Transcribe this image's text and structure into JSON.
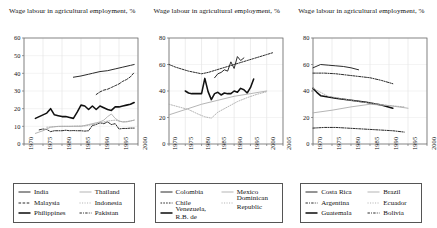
{
  "figure": {
    "title_shared": "Wage labour in agricultural employment, %",
    "panel_count": 3
  },
  "panels": [
    {
      "id": "panel-asia",
      "title": "Wage labour in agricultural employment, %",
      "yticks": [
        "0",
        "10",
        "20",
        "30",
        "40",
        "50",
        "60"
      ],
      "xticks": [
        "1970",
        "1975",
        "1980",
        "1985",
        "1990",
        "1995",
        "2000"
      ],
      "legend": [
        {
          "label": "India",
          "style": "solid",
          "weight": "medium",
          "color": "#2a2a2a"
        },
        {
          "label": "Thailand",
          "style": "solid",
          "weight": "thin",
          "color": "#a8a8a8"
        },
        {
          "label": "Malaysia",
          "style": "dashed",
          "weight": "medium",
          "color": "#2a2a2a"
        },
        {
          "label": "Indonesia",
          "style": "dotted",
          "weight": "thin",
          "color": "#b0b0b0"
        },
        {
          "label": "Philippines",
          "style": "solid",
          "weight": "bold",
          "color": "#111111"
        },
        {
          "label": "Pakistan",
          "style": "dashdot",
          "weight": "medium",
          "color": "#2a2a2a"
        }
      ]
    },
    {
      "id": "panel-latam-north",
      "title": "Wage labour in agricultural employment, %",
      "yticks": [
        "0",
        "20",
        "40",
        "60",
        "80"
      ],
      "xticks": [
        "1970",
        "1975",
        "1980",
        "1985",
        "1990",
        "1995",
        "2000",
        "2005"
      ],
      "legend": [
        {
          "label": "Colombia",
          "style": "solid",
          "weight": "medium",
          "color": "#2a2a2a"
        },
        {
          "label": "Mexico",
          "style": "solid",
          "weight": "thin",
          "color": "#a8a8a8"
        },
        {
          "label": "Chile",
          "style": "dotted",
          "weight": "medium",
          "color": "#2a2a2a"
        },
        {
          "label": "Dominican Republic",
          "style": "dotted",
          "weight": "thin",
          "color": "#b0b0b0"
        },
        {
          "label": "Venezuela, R.B. de",
          "style": "solid",
          "weight": "bold",
          "color": "#111111"
        },
        {
          "label": "",
          "style": "none",
          "weight": "none",
          "color": "#ffffff"
        }
      ]
    },
    {
      "id": "panel-latam-south",
      "title": "Wage labour in agricultural employment, %",
      "yticks": [
        "0",
        "20",
        "40",
        "60",
        "80"
      ],
      "xticks": [
        "1970",
        "1975",
        "1980",
        "1985",
        "1990",
        "1995",
        "2000"
      ],
      "legend": [
        {
          "label": "Costa Rica",
          "style": "solid",
          "weight": "medium",
          "color": "#2a2a2a"
        },
        {
          "label": "Brazil",
          "style": "solid",
          "weight": "thin",
          "color": "#a8a8a8"
        },
        {
          "label": "Argentina",
          "style": "dashdot",
          "weight": "medium",
          "color": "#2a2a2a"
        },
        {
          "label": "Ecuador",
          "style": "dotted",
          "weight": "thin",
          "color": "#b0b0b0"
        },
        {
          "label": "Guatemala",
          "style": "solid",
          "weight": "bold",
          "color": "#111111"
        },
        {
          "label": "Bolivia",
          "style": "dashdot",
          "weight": "medium",
          "color": "#2a2a2a"
        }
      ]
    }
  ],
  "chart_data": [
    {
      "type": "line",
      "id": "panel-asia",
      "title": "Wage labour in agricultural employment, %",
      "xlabel": "",
      "ylabel": "",
      "xlim": [
        1970,
        2000
      ],
      "ylim": [
        0,
        60
      ],
      "ytick_step": 10,
      "xtick_step": 5,
      "grid": true,
      "legend_position": "below",
      "series": [
        {
          "name": "Philippines",
          "style": "solid-bold",
          "x": [
            1973,
            1974,
            1975,
            1976,
            1977,
            1978,
            1979,
            1980,
            1981,
            1982,
            1983,
            1984,
            1985,
            1986,
            1987,
            1988,
            1989,
            1990,
            1991,
            1992,
            1993,
            1994,
            1995,
            1996,
            1997,
            1998,
            1999
          ],
          "y": [
            14.5,
            15.5,
            16.5,
            17.5,
            20.0,
            16.5,
            16.0,
            15.5,
            15.5,
            15.0,
            14.5,
            18.0,
            22.0,
            21.5,
            19.5,
            21.5,
            19.5,
            21.5,
            20.5,
            19.5,
            19.0,
            21.0,
            21.0,
            21.5,
            22.0,
            22.5,
            23.5
          ]
        },
        {
          "name": "India",
          "style": "solid-medium",
          "x": [
            1983,
            1985,
            1987,
            1988,
            1990,
            1992,
            1994,
            1996,
            1998,
            1999
          ],
          "y": [
            37.8,
            38.5,
            39.5,
            40.0,
            41.0,
            41.5,
            42.5,
            43.5,
            44.5,
            45.0
          ]
        },
        {
          "name": "Malaysia",
          "style": "dashed-medium",
          "x": [
            1989,
            1990,
            1991,
            1992,
            1993,
            1994,
            1995,
            1996,
            1997,
            1998,
            1999
          ],
          "y": [
            28.0,
            29.5,
            30.5,
            31.0,
            32.0,
            33.0,
            34.0,
            35.5,
            36.5,
            38.0,
            40.5
          ]
        },
        {
          "name": "Pakistan",
          "style": "dashdot-medium",
          "x": [
            1974,
            1975,
            1976,
            1977,
            1978,
            1979,
            1980,
            1981,
            1982,
            1983,
            1984,
            1985,
            1986,
            1987,
            1988,
            1989,
            1990,
            1991,
            1992,
            1993,
            1994,
            1995,
            1996,
            1997,
            1998,
            1999
          ],
          "y": [
            8.0,
            8.5,
            8.2,
            7.0,
            7.5,
            7.5,
            7.5,
            7.8,
            7.5,
            7.6,
            7.5,
            7.5,
            7.3,
            7.5,
            10.5,
            11.0,
            12.0,
            11.5,
            12.5,
            11.0,
            11.5,
            8.5,
            8.8,
            8.8,
            9.0,
            9.0
          ]
        },
        {
          "name": "Thailand",
          "style": "solid-thin",
          "x": [
            1973,
            1975,
            1977,
            1979,
            1981,
            1983,
            1985,
            1987,
            1989,
            1990,
            1991,
            1992,
            1993,
            1994,
            1995,
            1996,
            1997,
            1998,
            1999
          ],
          "y": [
            6.0,
            7.5,
            9.5,
            10.0,
            10.0,
            10.0,
            10.0,
            11.0,
            12.0,
            12.5,
            13.5,
            15.5,
            17.0,
            14.5,
            13.0,
            12.5,
            12.5,
            13.0,
            13.5
          ]
        },
        {
          "name": "Indonesia",
          "style": "dotted-thin",
          "x": [
            1976,
            1978,
            1980,
            1982,
            1984,
            1986,
            1988,
            1990,
            1992,
            1994,
            1996,
            1998,
            1999
          ],
          "y": [
            9.5,
            9.8,
            10.0,
            10.0,
            10.2,
            10.2,
            11.0,
            12.0,
            13.0,
            13.5,
            12.5,
            13.0,
            13.5
          ]
        }
      ]
    },
    {
      "type": "line",
      "id": "panel-latam-north",
      "title": "Wage labour in agricultural employment, %",
      "xlabel": "",
      "ylabel": "",
      "xlim": [
        1970,
        2005
      ],
      "ylim": [
        0,
        80
      ],
      "ytick_step": 20,
      "xtick_step": 5,
      "grid": true,
      "legend_position": "below",
      "series": [
        {
          "name": "Chile",
          "style": "dotted-medium",
          "x": [
            1970,
            1972,
            1974,
            1976,
            1978,
            1980,
            1982,
            1984,
            1986,
            1988,
            1990,
            1992,
            1994,
            1996,
            1998,
            2000,
            2002
          ],
          "y": [
            60.0,
            58.0,
            56.5,
            55.0,
            54.0,
            53.0,
            54.0,
            55.5,
            57.0,
            58.5,
            60.0,
            61.5,
            63.0,
            64.5,
            66.0,
            67.5,
            69.0
          ]
        },
        {
          "name": "Venezuela, R.B. de",
          "style": "solid-bold",
          "x": [
            1975,
            1976,
            1977,
            1978,
            1979,
            1980,
            1981,
            1982,
            1983,
            1984,
            1985,
            1986,
            1987,
            1988,
            1989,
            1990,
            1991,
            1992,
            1993,
            1994,
            1995,
            1996
          ],
          "y": [
            40.0,
            38.5,
            38.0,
            38.0,
            38.0,
            38.0,
            49.5,
            39.5,
            33.5,
            38.0,
            39.0,
            37.0,
            38.5,
            38.0,
            38.0,
            40.0,
            39.0,
            42.0,
            41.0,
            38.5,
            42.5,
            49.0
          ]
        },
        {
          "name": "Colombia",
          "style": "solid-medium",
          "x": [
            1984,
            1985,
            1986,
            1987,
            1988,
            1989,
            1990,
            1991,
            1992,
            1993
          ],
          "y": [
            50.0,
            53.0,
            54.0,
            56.0,
            55.0,
            62.0,
            57.0,
            66.0,
            63.0,
            65.0
          ]
        },
        {
          "name": "Mexico",
          "style": "solid-thin",
          "x": [
            1970,
            1975,
            1980,
            1985,
            1990,
            1995,
            2000
          ],
          "y": [
            22.0,
            26.0,
            30.0,
            33.0,
            36.0,
            38.0,
            40.0
          ]
        },
        {
          "name": "Dominican Republic",
          "style": "dotted-thin",
          "x": [
            1970,
            1973,
            1976,
            1979,
            1981,
            1983,
            1985,
            1988,
            1991,
            1994,
            1997,
            2000
          ],
          "y": [
            30.0,
            28.0,
            26.0,
            22.5,
            20.5,
            19.5,
            24.0,
            28.0,
            32.0,
            35.0,
            37.5,
            39.5
          ]
        }
      ]
    },
    {
      "type": "line",
      "id": "panel-latam-south",
      "title": "Wage labour in agricultural employment, %",
      "xlabel": "",
      "ylabel": "",
      "xlim": [
        1970,
        2000
      ],
      "ylim": [
        0,
        80
      ],
      "ytick_step": 20,
      "xtick_step": 5,
      "grid": true,
      "legend_position": "below",
      "series": [
        {
          "name": "Costa Rica",
          "style": "solid-medium",
          "x": [
            1970,
            1972,
            1974,
            1976,
            1978,
            1980,
            1982
          ],
          "y": [
            57.5,
            60.0,
            59.5,
            59.0,
            58.5,
            57.5,
            56.0
          ]
        },
        {
          "name": "Argentina",
          "style": "dashdot-medium",
          "x": [
            1970,
            1973,
            1976,
            1979,
            1982,
            1985,
            1988,
            1991
          ],
          "y": [
            53.5,
            53.5,
            53.0,
            52.0,
            51.0,
            50.0,
            48.0,
            45.5
          ]
        },
        {
          "name": "Guatemala",
          "style": "solid-bold",
          "x": [
            1970,
            1971,
            1972,
            1974,
            1976,
            1980,
            1984,
            1988,
            1991
          ],
          "y": [
            42.0,
            39.0,
            36.5,
            35.5,
            34.5,
            33.0,
            31.5,
            29.5,
            27.0
          ]
        },
        {
          "name": "Ecuador",
          "style": "dotted-thin",
          "x": [
            1970,
            1974,
            1978,
            1982,
            1986,
            1990,
            1994
          ],
          "y": [
            42.0,
            36.0,
            34.0,
            32.0,
            30.5,
            29.0,
            28.0
          ]
        },
        {
          "name": "Brazil",
          "style": "solid-thin",
          "x": [
            1970,
            1975,
            1980,
            1985,
            1990,
            1995
          ],
          "y": [
            23.5,
            25.5,
            28.0,
            30.0,
            29.0,
            27.0
          ]
        },
        {
          "name": "Bolivia",
          "style": "dashdot-medium",
          "x": [
            1970,
            1973,
            1976,
            1979,
            1982,
            1985,
            1988,
            1991,
            1994
          ],
          "y": [
            12.0,
            12.5,
            12.5,
            12.0,
            11.5,
            11.0,
            10.5,
            10.0,
            9.0
          ]
        }
      ]
    }
  ]
}
